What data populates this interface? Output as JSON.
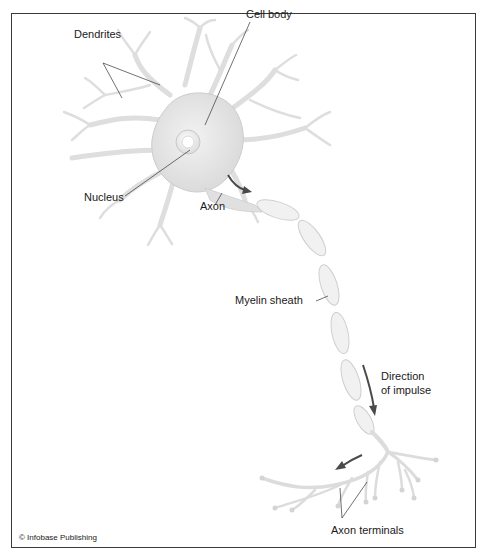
{
  "diagram": {
    "labels": {
      "dendrites": "Dendrites",
      "cell_body": "Cell body",
      "nucleus": "Nucleus",
      "axon": "Axon",
      "myelin_sheath": "Myelin sheath",
      "direction_line1": "Direction",
      "direction_line2": "of impulse",
      "axon_terminals": "Axon terminals"
    },
    "credit": "© Infobase Publishing",
    "colors": {
      "cell_fill": "#e6e6e6",
      "cell_stroke": "#c8c8c8",
      "myelin_fill": "#efefef",
      "arrow": "#4a4a4a",
      "leader_line": "#333333",
      "frame": "#3a3a3a"
    }
  }
}
